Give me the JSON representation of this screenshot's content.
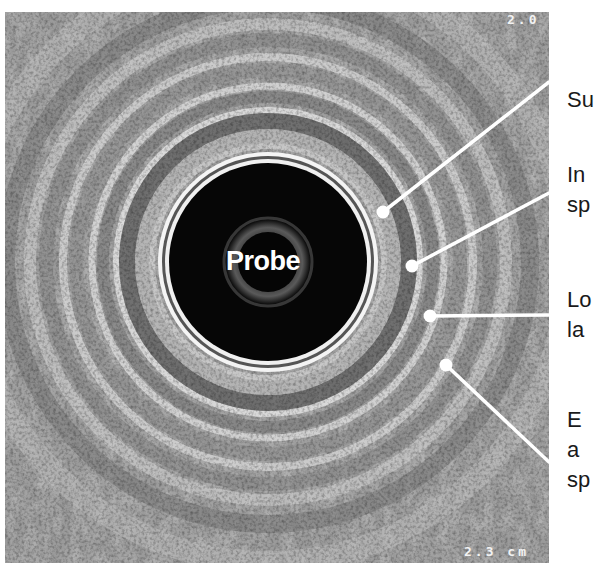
{
  "figure": {
    "type": "endoscopic ultrasound radial cross-section",
    "probe_label": "Probe",
    "scale_top": "2.0",
    "scale_bottom": "2.3 cm",
    "colors": {
      "background": "#ffffff",
      "annotation_text": "#1a1a1a",
      "leader_line": "#ffffff",
      "probe_core": "#050505"
    }
  },
  "annotations": [
    {
      "lines": [
        "Su"
      ],
      "note": "label truncated at image edge"
    },
    {
      "lines": [
        "In",
        "sp"
      ],
      "note": "label truncated at image edge"
    },
    {
      "lines": [
        "Lo",
        "la"
      ],
      "note": "label truncated at image edge"
    },
    {
      "lines": [
        "E",
        "a",
        "sp"
      ],
      "note": "label truncated at image edge"
    }
  ]
}
